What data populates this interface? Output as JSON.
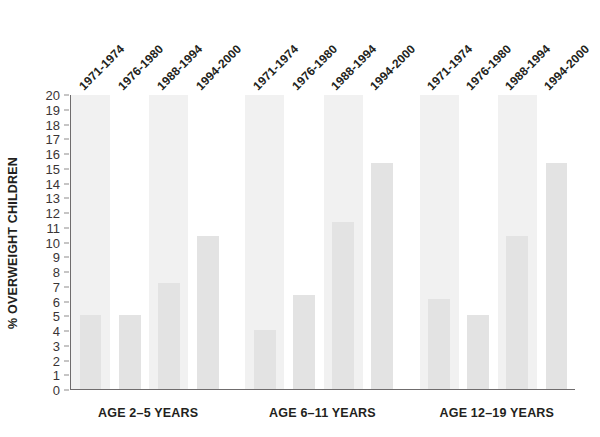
{
  "chart_data": {
    "type": "bar",
    "title": "",
    "xlabel": "",
    "ylabel": "% OVERWEIGHT CHILDREN",
    "ylim": [
      0,
      20
    ],
    "ytick_step": 1,
    "yticks": [
      "20",
      "19",
      "18",
      "17",
      "16",
      "15",
      "14",
      "13",
      "12",
      "11",
      "10",
      "9",
      "8",
      "7",
      "6",
      "5",
      "4",
      "3",
      "2",
      "1",
      "0"
    ],
    "grid": false,
    "legend": "none",
    "groups": [
      "AGE 2–5 YEARS",
      "AGE 6–11 YEARS",
      "AGE 12–19 YEARS"
    ],
    "categories": [
      "1971-1974",
      "1976-1980",
      "1988-1994",
      "1994-2000"
    ],
    "series": [
      {
        "name": "AGE 2–5 YEARS",
        "values": [
          5.0,
          5.0,
          7.2,
          10.4
        ]
      },
      {
        "name": "AGE 6–11 YEARS",
        "values": [
          4.0,
          6.4,
          11.3,
          15.3
        ]
      },
      {
        "name": "AGE 12–19 YEARS",
        "values": [
          6.1,
          5.0,
          10.4,
          15.3
        ]
      }
    ],
    "bar_color": "#e3e3e3",
    "stripe_color": "#f1f1f1",
    "axis_color": "#6f6c6d",
    "text_color": "#231f20"
  }
}
